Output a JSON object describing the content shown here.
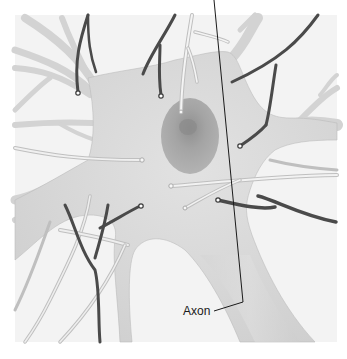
{
  "figure": {
    "labels": [
      {
        "text": "Axon"
      }
    ],
    "colors": {
      "background": "#ffffff",
      "panel": "#f2f2f2",
      "cell_body": "#d8d8d8",
      "nucleus": "#a8a8a8",
      "nucleolus": "#8e8e8e",
      "dark_terminal": "#4a4a4a",
      "light_terminal": "#ececec",
      "label_text": "#1a1a1a"
    }
  }
}
